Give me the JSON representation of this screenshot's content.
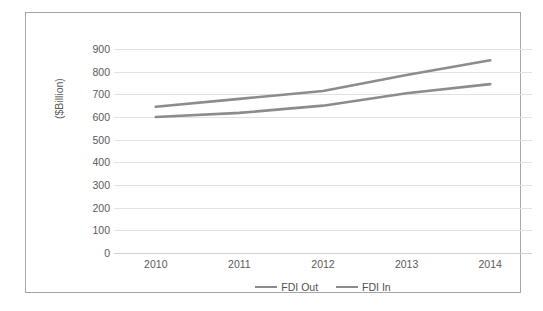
{
  "chart_data": {
    "type": "line",
    "title": "",
    "xlabel": "",
    "ylabel": "($Billion)",
    "categories": [
      "2010",
      "2011",
      "2012",
      "2013",
      "2014"
    ],
    "series": [
      {
        "name": "FDI Out",
        "values": [
          645,
          680,
          715,
          785,
          850
        ],
        "color": "#8c8c8c"
      },
      {
        "name": "FDI In",
        "values": [
          600,
          618,
          650,
          705,
          745
        ],
        "color": "#8c8c8c"
      }
    ],
    "ylim": [
      0,
      900
    ],
    "yticks": [
      0,
      100,
      200,
      300,
      400,
      500,
      600,
      700,
      800,
      900
    ],
    "ytick_labels": [
      "0",
      "100",
      "200",
      "300",
      "400",
      "500",
      "600",
      "700",
      "800",
      "900"
    ],
    "grid": true,
    "legend_position": "bottom"
  },
  "axis": {
    "y_title": "($Billion)"
  },
  "legend": {
    "entries": [
      {
        "label": "FDI Out"
      },
      {
        "label": "FDI In"
      }
    ]
  },
  "colors": {
    "line": "#8c8c8c",
    "gridline": "#e2e2e2",
    "frame": "#a6a6a6",
    "tick_text": "#5a5a5a",
    "background": "#ffffff"
  }
}
